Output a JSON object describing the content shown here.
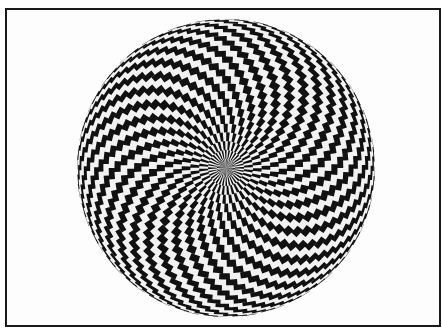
{
  "figure": {
    "colors": {
      "dark": "#111111",
      "light": "#f2f2f2",
      "frame": "#1a1a1a",
      "background": "#ffffff"
    },
    "sphere": {
      "cx": 226,
      "cy": 168,
      "r": 149,
      "rings": 26,
      "sectors": 64
    }
  }
}
